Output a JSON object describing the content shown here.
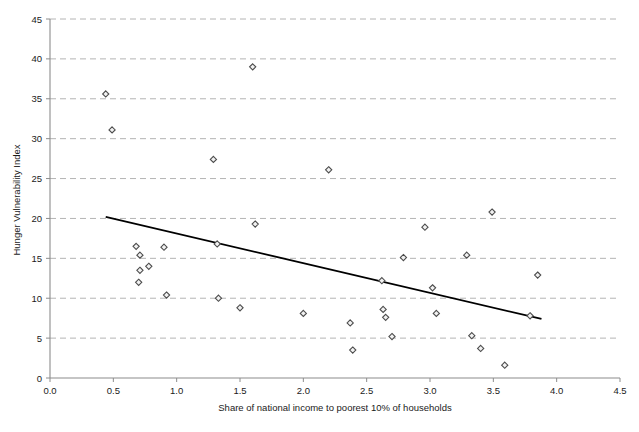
{
  "chart_data": {
    "type": "scatter",
    "title": "",
    "xlabel": "Share of national income to poorest 10% of households",
    "ylabel": "Hunger Vulnerability Index",
    "xlim": [
      0.0,
      4.5
    ],
    "ylim": [
      0,
      45
    ],
    "xticks": [
      "0.0",
      "0.5",
      "1.0",
      "1.5",
      "2.0",
      "2.5",
      "3.0",
      "3.5",
      "4.0",
      "4.5"
    ],
    "xtick_values": [
      0.0,
      0.5,
      1.0,
      1.5,
      2.0,
      2.5,
      3.0,
      3.5,
      4.0,
      4.5
    ],
    "yticks": [
      "0",
      "5",
      "10",
      "15",
      "20",
      "25",
      "30",
      "35",
      "40",
      "45"
    ],
    "ytick_values": [
      0,
      5,
      10,
      15,
      20,
      25,
      30,
      35,
      40,
      45
    ],
    "grid": "horizontal",
    "legend": "none",
    "marker": "diamond",
    "points": [
      {
        "x": 0.44,
        "y": 35.6
      },
      {
        "x": 0.49,
        "y": 31.1
      },
      {
        "x": 0.68,
        "y": 16.5
      },
      {
        "x": 0.71,
        "y": 15.4
      },
      {
        "x": 0.71,
        "y": 13.5
      },
      {
        "x": 0.7,
        "y": 12.0
      },
      {
        "x": 0.78,
        "y": 14.0
      },
      {
        "x": 0.9,
        "y": 16.4
      },
      {
        "x": 0.92,
        "y": 10.4
      },
      {
        "x": 1.29,
        "y": 27.4
      },
      {
        "x": 1.32,
        "y": 16.8
      },
      {
        "x": 1.33,
        "y": 10.0
      },
      {
        "x": 1.5,
        "y": 8.8
      },
      {
        "x": 1.6,
        "y": 39.0
      },
      {
        "x": 1.62,
        "y": 19.3
      },
      {
        "x": 2.0,
        "y": 8.1
      },
      {
        "x": 2.2,
        "y": 26.1
      },
      {
        "x": 2.37,
        "y": 6.9
      },
      {
        "x": 2.39,
        "y": 3.5
      },
      {
        "x": 2.62,
        "y": 12.2
      },
      {
        "x": 2.63,
        "y": 8.6
      },
      {
        "x": 2.65,
        "y": 7.6
      },
      {
        "x": 2.7,
        "y": 5.2
      },
      {
        "x": 2.79,
        "y": 15.1
      },
      {
        "x": 2.96,
        "y": 18.9
      },
      {
        "x": 3.02,
        "y": 11.3
      },
      {
        "x": 3.05,
        "y": 8.1
      },
      {
        "x": 3.29,
        "y": 15.4
      },
      {
        "x": 3.33,
        "y": 5.3
      },
      {
        "x": 3.4,
        "y": 3.7
      },
      {
        "x": 3.49,
        "y": 20.8
      },
      {
        "x": 3.59,
        "y": 1.6
      },
      {
        "x": 3.79,
        "y": 7.8
      },
      {
        "x": 3.85,
        "y": 12.9
      }
    ],
    "trendline": {
      "x0": 0.44,
      "y0": 20.2,
      "x1": 3.88,
      "y1": 7.4
    }
  }
}
